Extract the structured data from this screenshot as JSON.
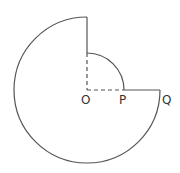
{
  "diagram": {
    "center": {
      "x": 87,
      "y": 90
    },
    "outer_radius": 73,
    "inner_radius": 37,
    "stroke_color": "#555555",
    "labels": {
      "O": "O",
      "P": "P",
      "Q": "Q"
    }
  }
}
